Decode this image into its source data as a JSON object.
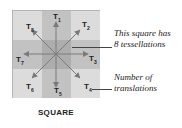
{
  "diagram": {
    "caption": "SQUARE",
    "labels": [
      {
        "id": "T1",
        "base": "T",
        "sub": "1"
      },
      {
        "id": "T2",
        "base": "T",
        "sub": "2"
      },
      {
        "id": "T3",
        "base": "T",
        "sub": "3"
      },
      {
        "id": "T4",
        "base": "T",
        "sub": "4"
      },
      {
        "id": "T5",
        "base": "T",
        "sub": "5"
      },
      {
        "id": "T6",
        "base": "T",
        "sub": "6"
      },
      {
        "id": "T7",
        "base": "T",
        "sub": "7"
      },
      {
        "id": "T8",
        "base": "T",
        "sub": "8"
      }
    ],
    "annotations": {
      "top_line1": "This square has",
      "top_line2": "8 tessellations",
      "bottom_line1": "Number of",
      "bottom_line2": "translations"
    },
    "colors": {
      "corner": "#dcdcdc",
      "edge": "#c2c2c2",
      "center": "#adadad",
      "arrow": "#7a7a7a"
    }
  }
}
